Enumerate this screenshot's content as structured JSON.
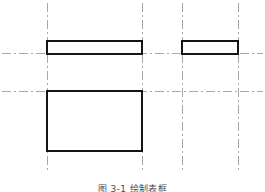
{
  "figure": {
    "caption": "图 3-1   绘制表框",
    "width": 265,
    "height": 192,
    "background_color": "#ffffff"
  },
  "style": {
    "object_line_color": "#151515",
    "object_line_width": 2,
    "object_fill_color": "#ffffff",
    "center_line_color": "#a8a8a8",
    "center_line_width": 1,
    "center_line_dash": "9 3 2 3"
  },
  "chart_data": {
    "type": "diagram",
    "title": "图 3-1   绘制表框",
    "xlim": [
      0,
      265
    ],
    "ylim": [
      0,
      192
    ],
    "grid": false,
    "legend": null,
    "rectangles": [
      {
        "name": "top-left-bar",
        "x": 47,
        "y": 41,
        "width": 95,
        "height": 13,
        "stroke": "#151515",
        "stroke_width": 2,
        "fill": "#ffffff"
      },
      {
        "name": "top-right-bar",
        "x": 182,
        "y": 41,
        "width": 56,
        "height": 13,
        "stroke": "#151515",
        "stroke_width": 2,
        "fill": "#ffffff"
      },
      {
        "name": "bottom-left-box",
        "x": 47,
        "y": 91,
        "width": 95,
        "height": 60,
        "stroke": "#151515",
        "stroke_width": 2,
        "fill": "#ffffff"
      }
    ],
    "vertical_center_lines": [
      {
        "name": "v-center-line-1",
        "x": 47,
        "y1": 3,
        "y2": 172
      },
      {
        "name": "v-center-line-2",
        "x": 142,
        "y1": 3,
        "y2": 172
      },
      {
        "name": "v-center-line-3",
        "x": 182,
        "y1": 3,
        "y2": 172
      },
      {
        "name": "v-center-line-4",
        "x": 238,
        "y1": 3,
        "y2": 172
      }
    ],
    "horizontal_center_lines": [
      {
        "name": "h-center-line-upper",
        "y": 53,
        "x1": 2,
        "x2": 263
      },
      {
        "name": "h-center-line-lower",
        "y": 91,
        "x1": 2,
        "x2": 263
      }
    ]
  }
}
